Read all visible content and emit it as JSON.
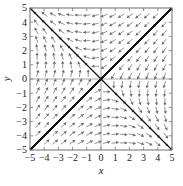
{
  "figure": {
    "kind": "direction-field-phase-portrait",
    "background_color": "#ffffff",
    "frame_color": "#7a7a7a",
    "trajectory_color": "#101010",
    "arrow_color": "#6e6e6e",
    "axis_line_color": "#8a8a8a",
    "tick_color": "#7a7a7a"
  },
  "chart_data": {
    "type": "scatter",
    "title": "",
    "subtitle": "",
    "xlabel": "x",
    "ylabel": "y",
    "xlim": [
      -5,
      5
    ],
    "ylim": [
      -5,
      5
    ],
    "grid": false,
    "legend": null,
    "x_ticks": [
      -5,
      -4,
      -3,
      -2,
      -1,
      0,
      1,
      2,
      3,
      4,
      5
    ],
    "y_ticks": [
      -5,
      -4,
      -3,
      -2,
      -1,
      0,
      1,
      2,
      3,
      4,
      5
    ],
    "x_tick_labels": [
      "−5",
      "−4",
      "−3",
      "−2",
      "−1",
      "0",
      "1",
      "2",
      "3",
      "4",
      "5"
    ],
    "y_tick_labels": [
      "−5",
      "−4",
      "−3",
      "−2",
      "−1",
      "0",
      "1",
      "2",
      "3",
      "4",
      "5"
    ],
    "equilibrium_points": [
      {
        "x": 0,
        "y": 0,
        "classification": "node"
      }
    ],
    "vector_field": {
      "description": "Direction field arrows on a regular grid; arrows point rightward above the x-axis on the left half, downward in the upper right, leftward below the x-axis on the right half, and upward in the lower left.",
      "grid_x": [
        -4.5,
        -3.9,
        -3.3,
        -2.7,
        -2.1,
        -1.5,
        -0.9,
        -0.3,
        0.3,
        0.9,
        1.5,
        2.1,
        2.7,
        3.3,
        3.9,
        4.5
      ],
      "grid_y": [
        -4.5,
        -3.9,
        -3.3,
        -2.7,
        -2.1,
        -1.5,
        -0.9,
        -0.3,
        0.3,
        0.9,
        1.5,
        2.1,
        2.7,
        3.3,
        3.9,
        4.5
      ],
      "u_formula": "-x - 3*y",
      "v_formula": "-3*x - y",
      "quadrant_directions": {
        "upper_left": "right",
        "upper_right": "down",
        "lower_left": "up",
        "lower_right": "left"
      }
    },
    "trajectories": {
      "count": 18,
      "description": "Solution curves that all approach the origin, hugging two straight-line eigendirections through the origin (one with positive slope, one with negative slope)",
      "eigendirection_slopes": [
        1.0,
        -1.0
      ]
    }
  }
}
